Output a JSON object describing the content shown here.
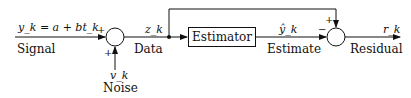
{
  "diagram": {
    "signal": {
      "equation": "y_k  =  a  +  bt_k",
      "label": "Signal"
    },
    "noise": {
      "symbol": "v_k",
      "label": "Noise"
    },
    "data": {
      "symbol": "z_k",
      "label": "Data"
    },
    "estimator": {
      "label": "Estimator"
    },
    "estimate": {
      "symbol": "ŷ_k",
      "label": "Estimate"
    },
    "residual": {
      "symbol": "r_k",
      "label": "Residual"
    },
    "junction1_signs": {
      "left": "+",
      "bottom": "+"
    },
    "junction2_signs": {
      "left": "−",
      "top": "+"
    }
  }
}
